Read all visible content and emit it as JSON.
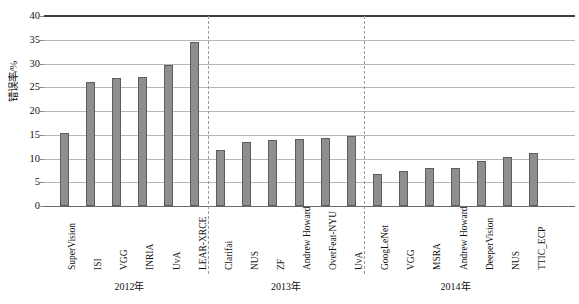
{
  "chart_data": {
    "type": "bar",
    "title": "",
    "xlabel": "",
    "ylabel": "错误率/%",
    "ylim": [
      0,
      40
    ],
    "yticks": [
      0,
      5,
      10,
      15,
      20,
      25,
      30,
      35,
      40
    ],
    "grid": true,
    "legend": "none",
    "categories": [
      "SuperVision",
      "ISI",
      "VGG",
      "INRIA",
      "UvA",
      "LEAR-XRCE",
      "Clarifai",
      "NUS",
      "ZF",
      "Andrew Howard",
      "OverFeat-NYU",
      "UvA",
      "GoogLeNet",
      "VGG",
      "MSRA",
      "Andrew Howard",
      "DeeperVision",
      "NUS",
      "TTIC_ECP"
    ],
    "values": [
      15.3,
      26.2,
      27.0,
      27.1,
      29.6,
      34.5,
      11.7,
      13.5,
      14.0,
      14.2,
      14.4,
      14.8,
      6.7,
      7.3,
      8.1,
      8.1,
      9.5,
      10.4,
      11.2
    ],
    "groups": [
      {
        "label": "2012年",
        "start": 0,
        "count": 6
      },
      {
        "label": "2013年",
        "start": 6,
        "count": 6
      },
      {
        "label": "2014年",
        "start": 12,
        "count": 7
      }
    ],
    "bar_color": "#8e8e8e",
    "bar_border_color": "#5d5d5d",
    "gridline_color": "#b6b6b6",
    "separator_color": "#9a9a9a",
    "separator_style": "dashed"
  }
}
